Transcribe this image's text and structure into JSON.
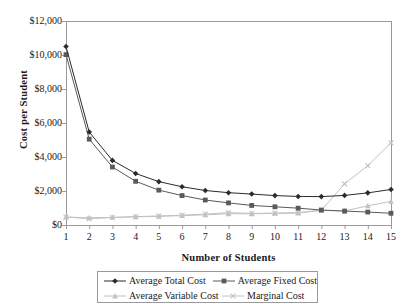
{
  "chart_data": {
    "type": "line",
    "title": "",
    "xlabel": "Number of Students",
    "ylabel": "Cost per Student",
    "x": [
      1,
      2,
      3,
      4,
      5,
      6,
      7,
      8,
      9,
      10,
      11,
      12,
      13,
      14,
      15
    ],
    "categories": [
      "1",
      "2",
      "3",
      "4",
      "5",
      "6",
      "7",
      "8",
      "9",
      "10",
      "11",
      "12",
      "13",
      "14",
      "15"
    ],
    "xlim": [
      1,
      15
    ],
    "ylim": [
      0,
      12000
    ],
    "ytick_values": [
      0,
      2000,
      4000,
      6000,
      8000,
      10000,
      12000
    ],
    "ytick_labels": [
      "$0",
      "$2,000",
      "$4,000",
      "$6,000",
      "$8,000",
      "$10,000",
      "$12,000"
    ],
    "grid": false,
    "legend_position": "bottom",
    "series": [
      {
        "name": "Average Total Cost",
        "marker": "diamond",
        "color": "#2b2b2b",
        "values": [
          10500,
          5470,
          3800,
          3030,
          2550,
          2250,
          2030,
          1900,
          1820,
          1730,
          1680,
          1670,
          1740,
          1890,
          2090
        ]
      },
      {
        "name": "Average Fixed Cost",
        "marker": "square",
        "color": "#5a5a5a",
        "values": [
          10020,
          5050,
          3410,
          2570,
          2050,
          1730,
          1470,
          1300,
          1150,
          1070,
          990,
          880,
          820,
          760,
          690
        ]
      },
      {
        "name": "Average Variable Cost",
        "marker": "triangle",
        "color": "#c2c2c2",
        "values": [
          470,
          420,
          450,
          480,
          510,
          550,
          600,
          660,
          660,
          680,
          700,
          860,
          820,
          1130,
          1390
        ]
      },
      {
        "name": "Marginal Cost",
        "marker": "cross",
        "color": "#c2c2c2",
        "values": [
          470,
          370,
          440,
          490,
          530,
          580,
          640,
          730,
          680,
          700,
          730,
          870,
          2420,
          3490,
          4830
        ]
      }
    ]
  },
  "axes": {
    "y_title": "Cost per Student",
    "x_title": "Number of Students"
  },
  "legend": {
    "items": [
      {
        "label": "Average Total Cost",
        "marker": "diamond",
        "color": "#2b2b2b"
      },
      {
        "label": "Average Fixed Cost",
        "marker": "square",
        "color": "#5a5a5a"
      },
      {
        "label": "Average Variable Cost",
        "marker": "triangle",
        "color": "#c2c2c2"
      },
      {
        "label": "Marginal Cost",
        "marker": "cross",
        "color": "#c2c2c2"
      }
    ]
  },
  "colors": {
    "frame": "#9a9a9a",
    "background": "#ffffff",
    "text": "#1a1a1a"
  }
}
